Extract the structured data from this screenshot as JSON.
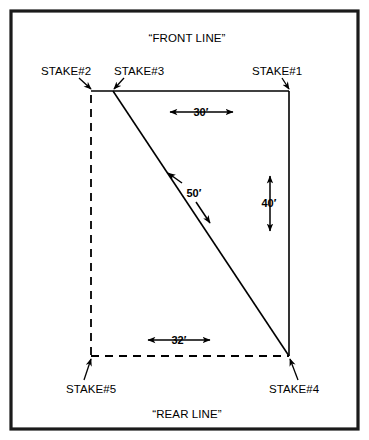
{
  "diagram": {
    "title_top": "“FRONT LINE”",
    "title_bottom": "“REAR LINE”",
    "stakes": [
      {
        "id": "stake-1",
        "label": "STAKE#1",
        "x": 289,
        "y": 91
      },
      {
        "id": "stake-2",
        "label": "STAKE#2",
        "x": 91,
        "y": 91
      },
      {
        "id": "stake-3",
        "label": "STAKE#3",
        "x": 113,
        "y": 91
      },
      {
        "id": "stake-4",
        "label": "STAKE#4",
        "x": 289,
        "y": 356
      },
      {
        "id": "stake-5",
        "label": "STAKE#5",
        "x": 91,
        "y": 356
      }
    ],
    "dimensions": [
      {
        "id": "dim-30",
        "label": "30′",
        "value": 30,
        "unit": "feet",
        "between": [
          "STAKE#3",
          "STAKE#1"
        ],
        "orientation": "horizontal"
      },
      {
        "id": "dim-40",
        "label": "40′",
        "value": 40,
        "unit": "feet",
        "between": [
          "STAKE#1",
          "STAKE#4"
        ],
        "orientation": "vertical"
      },
      {
        "id": "dim-50",
        "label": "50′",
        "value": 50,
        "unit": "feet",
        "between": [
          "STAKE#3",
          "STAKE#4"
        ],
        "orientation": "diagonal"
      },
      {
        "id": "dim-32",
        "label": "32′",
        "value": 32,
        "unit": "feet",
        "between": [
          "STAKE#5",
          "STAKE#4"
        ],
        "orientation": "horizontal"
      }
    ],
    "colors": {
      "ink": "#000000",
      "frame": "#1a1a1a",
      "background": "#ffffff"
    }
  }
}
